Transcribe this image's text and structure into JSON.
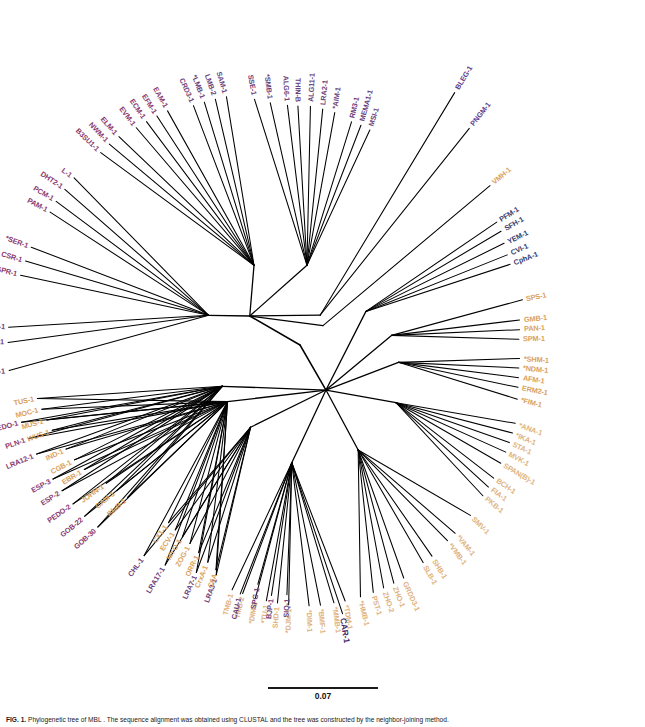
{
  "figure": {
    "domain": "phylogenetic-tree",
    "tree_type": "unrooted radial cladogram",
    "background": "#ffffff",
    "line_color": "#000000",
    "scale_bar": {
      "value": "0.07",
      "unit": "substitutions per site",
      "length_px": 110
    },
    "caption": {
      "fig_number": "FIG. 1.",
      "text": "  Phylogenetic tree of MBL . The sequence alignment was obtained using CLUSTAL and the tree was constructed by the neighbor-joining method."
    },
    "color_legend": [
      {
        "key": "grp-purple",
        "hex": "#6b3f7a",
        "name": "subclass B1 / B1-related"
      },
      {
        "key": "grp-magenta",
        "hex": "#8b3a6e",
        "name": "subclass B1 divergent"
      },
      {
        "key": "grp-violet",
        "hex": "#5e3a8c",
        "name": "B1 outlier"
      },
      {
        "key": "grp-blue",
        "hex": "#33406e",
        "name": "subclass B2"
      },
      {
        "key": "grp-orange",
        "hex": "#d9a15e",
        "name": "subclass B3"
      },
      {
        "key": "grp-tan",
        "hex": "#e0b27e",
        "name": "subclass B3 divergent"
      }
    ]
  },
  "chart_data": {
    "type": "tree",
    "title": "Phylogenetic tree of MBL",
    "layout": "unrooted radial",
    "scale": "0.07",
    "n_leaves": 118,
    "center": {
      "x": 300,
      "y": 345
    },
    "leaves": [
      {
        "label": "LRA3-1",
        "angle": 200.0,
        "r": 245,
        "group": "grp-purple"
      },
      {
        "label": "LRA7-1",
        "angle": 204.5,
        "r": 250,
        "group": "grp-purple"
      },
      {
        "label": "LRA17-1",
        "angle": 211.5,
        "r": 258,
        "group": "grp-purple"
      },
      {
        "label": "CHL-1",
        "angle": 216.5,
        "r": 262,
        "group": "grp-purple"
      },
      {
        "label": "GOB-30",
        "angle": 228.0,
        "r": 272,
        "group": "grp-magenta"
      },
      {
        "label": "GOB-22",
        "angle": 231.5,
        "r": 275,
        "group": "grp-magenta"
      },
      {
        "label": "PEDO-2",
        "angle": 235.0,
        "r": 277,
        "group": "grp-magenta"
      },
      {
        "label": "ESP-2",
        "angle": 238.5,
        "r": 279,
        "group": "grp-magenta"
      },
      {
        "label": "ESP-3",
        "angle": 241.5,
        "r": 281,
        "group": "grp-magenta"
      },
      {
        "label": "LRA12-1",
        "angle": 247.5,
        "r": 285,
        "group": "grp-magenta"
      },
      {
        "label": "PLN-1",
        "angle": 251.0,
        "r": 287,
        "group": "grp-magenta"
      },
      {
        "label": "PEDO-1",
        "angle": 254.5,
        "r": 289,
        "group": "grp-magenta"
      },
      {
        "label": "AM1-1",
        "angle": 265.0,
        "r": 292,
        "group": "grp-purple"
      },
      {
        "label": "FEZ-1",
        "angle": 270.5,
        "r": 292,
        "group": "grp-purple"
      },
      {
        "label": "B3SU2-1",
        "angle": 273.5,
        "r": 292,
        "group": "grp-purple"
      },
      {
        "label": "SPR-1",
        "angle": 284.0,
        "r": 288,
        "group": "grp-magenta"
      },
      {
        "label": "CSR-1",
        "angle": 287.0,
        "r": 287,
        "group": "grp-magenta"
      },
      {
        "label": "*SER-1",
        "angle": 290.0,
        "r": 286,
        "group": "grp-magenta"
      },
      {
        "label": "PAM-1",
        "angle": 298.0,
        "r": 283,
        "group": "grp-magenta"
      },
      {
        "label": "PCM-1",
        "angle": 300.5,
        "r": 283,
        "group": "grp-magenta"
      },
      {
        "label": "DHT2-1",
        "angle": 303.5,
        "r": 282,
        "group": "grp-magenta"
      },
      {
        "label": "L-1",
        "angle": 306.5,
        "r": 281,
        "group": "grp-magenta"
      },
      {
        "label": "B3SU1-1",
        "angle": 314.0,
        "r": 277,
        "group": "grp-magenta"
      },
      {
        "label": "NWM-1",
        "angle": 316.5,
        "r": 277,
        "group": "grp-magenta"
      },
      {
        "label": "ELM-1",
        "angle": 319.0,
        "r": 276,
        "group": "grp-magenta"
      },
      {
        "label": "EVM-1",
        "angle": 323.0,
        "r": 272,
        "group": "grp-magenta"
      },
      {
        "label": "ECM-1",
        "angle": 325.5,
        "r": 271,
        "group": "grp-magenta"
      },
      {
        "label": "EFM-1",
        "angle": 328.0,
        "r": 270,
        "group": "grp-magenta"
      },
      {
        "label": "EAM-1",
        "angle": 330.5,
        "r": 269,
        "group": "grp-magenta"
      },
      {
        "label": "CRD3-1",
        "angle": 336.0,
        "r": 262,
        "group": "grp-purple"
      },
      {
        "label": "*LMB-1",
        "angle": 338.5,
        "r": 261,
        "group": "grp-purple"
      },
      {
        "label": "LMB-2",
        "angle": 341.0,
        "r": 260,
        "group": "grp-purple"
      },
      {
        "label": "SAM-1",
        "angle": 343.5,
        "r": 259,
        "group": "grp-purple"
      },
      {
        "label": "SSE-1",
        "angle": 349.5,
        "r": 250,
        "group": "grp-purple"
      },
      {
        "label": "*SMB-1",
        "angle": 353.0,
        "r": 244,
        "group": "grp-purple"
      },
      {
        "label": "ALG6-1",
        "angle": 357.0,
        "r": 240,
        "group": "grp-purple"
      },
      {
        "label": "THIN-B",
        "angle": 359.5,
        "r": 239,
        "group": "grp-purple"
      },
      {
        "label": "ALG11-1",
        "angle": 2.5,
        "r": 239,
        "group": "grp-purple"
      },
      {
        "label": "LRA2-1",
        "angle": 5.5,
        "r": 237,
        "group": "grp-purple"
      },
      {
        "label": "*AIM-1",
        "angle": 8.5,
        "r": 235,
        "group": "grp-purple"
      },
      {
        "label": "RM3-1",
        "angle": 13.0,
        "r": 229,
        "group": "grp-purple"
      },
      {
        "label": "MEMA1-1",
        "angle": 15.5,
        "r": 228,
        "group": "grp-purple"
      },
      {
        "label": "MSI-1",
        "angle": 18.0,
        "r": 226,
        "group": "grp-purple"
      },
      {
        "label": "BLEG-1",
        "angle": 31.5,
        "r": 296,
        "group": "grp-violet"
      },
      {
        "label": "PNGM-1",
        "angle": 38.0,
        "r": 275,
        "group": "grp-violet"
      },
      {
        "label": "VMH-1",
        "angle": 50.0,
        "r": 248,
        "group": "grp-orange"
      },
      {
        "label": "PFM-1",
        "angle": 58.0,
        "r": 232,
        "group": "grp-blue"
      },
      {
        "label": "SFH-1",
        "angle": 60.5,
        "r": 231,
        "group": "grp-blue"
      },
      {
        "label": "YEM-1",
        "angle": 63.5,
        "r": 228,
        "group": "grp-blue"
      },
      {
        "label": "CVI-1",
        "angle": 66.5,
        "r": 226,
        "group": "grp-blue"
      },
      {
        "label": "CphA-1",
        "angle": 69.0,
        "r": 225,
        "group": "grp-blue"
      },
      {
        "label": "SPS-1",
        "angle": 78.5,
        "r": 227,
        "group": "grp-orange"
      },
      {
        "label": "GMB-1",
        "angle": 83.5,
        "r": 221,
        "group": "grp-orange"
      },
      {
        "label": "PAN-1",
        "angle": 86.0,
        "r": 220,
        "group": "grp-orange"
      },
      {
        "label": "SPM-1",
        "angle": 88.5,
        "r": 219,
        "group": "grp-orange"
      },
      {
        "label": "*SHM-1",
        "angle": 93.5,
        "r": 220,
        "group": "grp-orange"
      },
      {
        "label": "*NDM-1",
        "angle": 96.0,
        "r": 220,
        "group": "grp-orange"
      },
      {
        "label": "AFM-1",
        "angle": 98.5,
        "r": 221,
        "group": "grp-orange"
      },
      {
        "label": "ERM2-1",
        "angle": 101.0,
        "r": 222,
        "group": "grp-orange"
      },
      {
        "label": "*FIM-1",
        "angle": 104.0,
        "r": 224,
        "group": "grp-orange"
      },
      {
        "label": "*ANA-1",
        "angle": 110.0,
        "r": 229,
        "group": "grp-tan"
      },
      {
        "label": "*IKA-1",
        "angle": 112.5,
        "r": 230,
        "group": "grp-tan"
      },
      {
        "label": "STA-1",
        "angle": 115.0,
        "r": 231,
        "group": "grp-tan"
      },
      {
        "label": "MVK-1",
        "angle": 117.5,
        "r": 232,
        "group": "grp-tan"
      },
      {
        "label": "SPAN(B)-1",
        "angle": 120.5,
        "r": 233,
        "group": "grp-tan"
      },
      {
        "label": "BCH-1",
        "angle": 124.5,
        "r": 235,
        "group": "grp-tan"
      },
      {
        "label": "FIA-1",
        "angle": 127.0,
        "r": 236,
        "group": "grp-tan"
      },
      {
        "label": "PKB-1",
        "angle": 129.5,
        "r": 237,
        "group": "grp-tan"
      },
      {
        "label": "SMV-1",
        "angle": 135.0,
        "r": 241,
        "group": "grp-tan"
      },
      {
        "label": "*VAM-1",
        "angle": 140.5,
        "r": 244,
        "group": "grp-tan"
      },
      {
        "label": "*VMB-1",
        "angle": 143.0,
        "r": 245,
        "group": "grp-tan"
      },
      {
        "label": "SHB-1",
        "angle": 148.0,
        "r": 249,
        "group": "grp-tan"
      },
      {
        "label": "SLB-1",
        "angle": 150.5,
        "r": 250,
        "group": "grp-tan"
      },
      {
        "label": "GRDD3-1",
        "angle": 156.0,
        "r": 255,
        "group": "grp-tan"
      },
      {
        "label": "ZHO-1",
        "angle": 158.5,
        "r": 256,
        "group": "grp-tan"
      },
      {
        "label": "ZHO-2",
        "angle": 161.0,
        "r": 257,
        "group": "grp-tan"
      },
      {
        "label": "PST-1",
        "angle": 163.5,
        "r": 258,
        "group": "grp-tan"
      },
      {
        "label": "*HMB-1",
        "angle": 166.5,
        "r": 259,
        "group": "grp-tan"
      },
      {
        "label": "*TDM-1",
        "angle": 170.0,
        "r": 260,
        "group": "grp-tan"
      },
      {
        "label": "*MMB-1",
        "angle": 172.5,
        "r": 260,
        "group": "grp-tan"
      },
      {
        "label": "*BMF-1",
        "angle": 175.5,
        "r": 261,
        "group": "grp-tan"
      },
      {
        "label": "*DIM-1",
        "angle": 178.0,
        "r": 261,
        "group": "grp-tan"
      },
      {
        "label": "*DJM-1",
        "angle": 182.5,
        "r": 260,
        "group": "grp-tan"
      },
      {
        "label": "SHD-1",
        "angle": 185.0,
        "r": 259,
        "group": "grp-tan"
      },
      {
        "label": "*TU-1",
        "angle": 187.5,
        "r": 258,
        "group": "grp-tan"
      },
      {
        "label": "*DIM-2",
        "angle": 190.0,
        "r": 257,
        "group": "grp-tan"
      },
      {
        "label": "TMB-2",
        "angle": 193.0,
        "r": 255,
        "group": "grp-tan"
      },
      {
        "label": "TMB-1",
        "angle": 195.5,
        "r": 254,
        "group": "grp-tan"
      },
      {
        "label": "C6A",
        "angle": 200.5,
        "r": 240,
        "group": "grp-orange"
      },
      {
        "label": "CrxA-1",
        "angle": 203.0,
        "r": 236,
        "group": "grp-orange"
      },
      {
        "label": "ORR-1",
        "angle": 206.0,
        "r": 231,
        "group": "grp-orange"
      },
      {
        "label": "ZOG-1",
        "angle": 209.0,
        "r": 227,
        "group": "grp-orange"
      },
      {
        "label": "MYO-1",
        "angle": 211.5,
        "r": 225,
        "group": "grp-orange"
      },
      {
        "label": "ECV-1",
        "angle": 214.0,
        "r": 223,
        "group": "grp-orange"
      },
      {
        "label": "CX1-1",
        "angle": 216.5,
        "r": 221,
        "group": "grp-orange"
      },
      {
        "label": "BlaB-1",
        "angle": 228.5,
        "r": 230,
        "group": "grp-orange"
      },
      {
        "label": "CAM-1",
        "angle": 231.5,
        "r": 234,
        "group": "grp-orange"
      },
      {
        "label": "JOHN-1",
        "angle": 234.5,
        "r": 238,
        "group": "grp-orange"
      },
      {
        "label": "EBR-1",
        "angle": 240.0,
        "r": 249,
        "group": "grp-orange"
      },
      {
        "label": "CGB-1",
        "angle": 243.0,
        "r": 253,
        "group": "grp-orange"
      },
      {
        "label": "IND-1",
        "angle": 246.0,
        "r": 256,
        "group": "grp-orange"
      },
      {
        "label": "WUS-1",
        "angle": 251.0,
        "r": 262,
        "group": "grp-orange",
        "style": "grp-italic"
      },
      {
        "label": "MUS-1",
        "angle": 253.5,
        "r": 264,
        "group": "grp-orange"
      },
      {
        "label": "MOC-1",
        "angle": 256.0,
        "r": 266,
        "group": "grp-orange"
      },
      {
        "label": "TUS-1",
        "angle": 258.5,
        "r": 268,
        "group": "grp-orange"
      },
      {
        "label": "CAR-1",
        "angle": 171.0,
        "r": 272,
        "group": "grp-bold"
      },
      {
        "label": "SIQ-1",
        "angle": 183.0,
        "r": 250,
        "group": "grp-purple"
      },
      {
        "label": "BJP-1",
        "angle": 186.5,
        "r": 252,
        "group": "grp-purple"
      },
      {
        "label": "SPG-1",
        "angle": 190.0,
        "r": 243,
        "group": "grp-purple"
      },
      {
        "label": "CAU-1",
        "angle": 193.5,
        "r": 256,
        "group": "grp-purple"
      }
    ],
    "internal_nodes": [
      {
        "id": "root",
        "x": 300,
        "y": 345
      },
      {
        "id": "n-b1",
        "x": 298,
        "y": 287
      },
      {
        "id": "n-b1a",
        "x": 295,
        "y": 270
      },
      {
        "id": "n-b2",
        "x": 272,
        "y": 400
      },
      {
        "id": "n-b3",
        "x": 266,
        "y": 415
      }
    ]
  }
}
